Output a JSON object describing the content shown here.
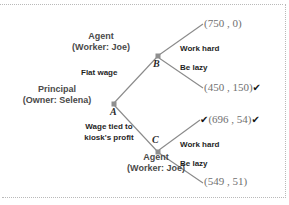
{
  "diagram": {
    "nodes": {
      "a": {
        "id": "A",
        "player_line1": "Principal",
        "player_line2": "(Owner: Selena)"
      },
      "b": {
        "id": "B",
        "player_line1": "Agent",
        "player_line2": "(Worker: Joe)"
      },
      "c": {
        "id": "C",
        "player_line1": "Agent",
        "player_line2": "(Worker: Joe)"
      }
    },
    "edges": {
      "flat_wage": "Flat wage",
      "profit_wage_line1": "Wage tied to",
      "profit_wage_line2": "kiosk's profit",
      "b_work_hard": "Work hard",
      "b_be_lazy": "Be lazy",
      "c_work_hard": "Work hard",
      "c_be_lazy": "Be lazy"
    },
    "payoffs": {
      "b_work_hard": {
        "text": "(750 , 0)",
        "check_before": "",
        "check_after": ""
      },
      "b_be_lazy": {
        "text": "(450 , 150)",
        "check_before": "",
        "check_after": "✔"
      },
      "c_work_hard": {
        "text": "(696 , 54)",
        "check_before": "✔",
        "check_after": "✔"
      },
      "c_be_lazy": {
        "text": "(549 , 51)",
        "check_before": "",
        "check_after": ""
      }
    },
    "colors": {
      "line": "#8a8a8a",
      "node": "#9a9a9a",
      "payoff_text": "#6f6f6f",
      "label_text": "#2e2e2e",
      "frame": "#b9b9b9"
    }
  }
}
